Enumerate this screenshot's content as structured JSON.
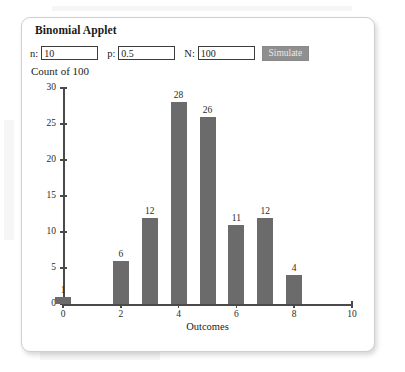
{
  "panel": {
    "title": "Binomial Applet"
  },
  "controls": {
    "n_label": "n:",
    "n_value": "10",
    "p_label": "p:",
    "p_value": "0.5",
    "N_label": "N:",
    "N_value": "100",
    "simulate_label": "Simulate"
  },
  "chart_header": "Count of 100",
  "colors": {
    "bar": "#6b6b6b",
    "axis": "#4a4a4a",
    "button": "#8f8f8f",
    "panel_border": "#cfcfcf"
  },
  "chart_data": {
    "type": "bar",
    "title": "Count of 100",
    "xlabel": "Outcomes",
    "ylabel": "",
    "categories": [
      "0",
      "1",
      "2",
      "3",
      "4",
      "5",
      "6",
      "7",
      "8",
      "9",
      "10"
    ],
    "values": [
      1,
      0,
      6,
      12,
      28,
      26,
      11,
      12,
      4,
      0,
      0
    ],
    "bar_labels": [
      "1",
      "",
      "6",
      "12",
      "28",
      "26",
      "11",
      "12",
      "4",
      "",
      ""
    ],
    "xlim": [
      0,
      10
    ],
    "ylim": [
      0,
      30
    ],
    "yticks": [
      0,
      5,
      10,
      15,
      20,
      25,
      30
    ],
    "ytick_labels": [
      "0",
      "5",
      "10",
      "15",
      "20",
      "25",
      "30"
    ],
    "xticks": [
      0,
      2,
      4,
      6,
      8,
      10
    ],
    "xtick_labels": [
      "0",
      "2",
      "4",
      "6",
      "8",
      "10"
    ],
    "grid": false,
    "legend": null
  }
}
